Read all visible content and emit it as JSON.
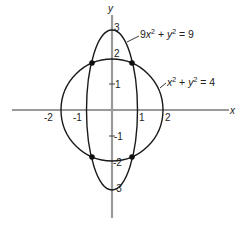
{
  "figure": {
    "axes": {
      "x_label": "x",
      "y_label": "y",
      "x_ticks": [
        "-2",
        "-1",
        "1",
        "2"
      ],
      "y_ticks": [
        "3",
        "2",
        "1",
        "-1",
        "-2",
        "-3"
      ]
    },
    "curves": [
      {
        "name": "ellipse",
        "equation_parts": [
          "9",
          "x",
          "2",
          " + ",
          "y",
          "2",
          " = 9"
        ],
        "equation": "9x² + y² = 9"
      },
      {
        "name": "circle",
        "equation_parts": [
          "",
          "x",
          "2",
          " + ",
          "y",
          "2",
          " = 4"
        ],
        "equation": "x² + y² = 4"
      }
    ],
    "intersection_points": [
      {
        "x": 0.79,
        "y": 1.84
      },
      {
        "x": -0.79,
        "y": 1.84
      },
      {
        "x": 0.79,
        "y": -1.84
      },
      {
        "x": -0.79,
        "y": -1.84
      }
    ],
    "colors": {
      "axis": "#9a9a9a",
      "curve": "#1a1a1a",
      "point": "#111111"
    }
  }
}
